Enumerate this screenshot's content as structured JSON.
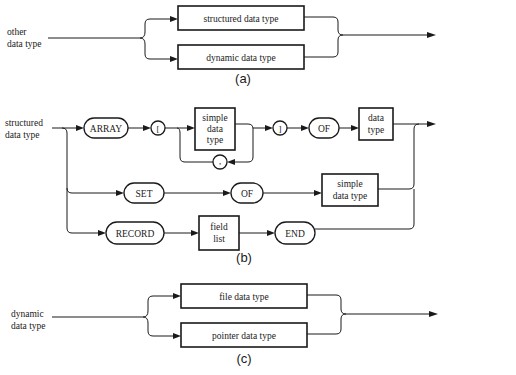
{
  "diagram_a": {
    "caption": "(a)",
    "input_label_line1": "other",
    "input_label_line2": "data type",
    "boxes": [
      "structured data type",
      "dynamic data type"
    ]
  },
  "diagram_b": {
    "caption": "(b)",
    "input_label_line1": "structured",
    "input_label_line2": "data type",
    "array_row": {
      "keyword": "ARRAY",
      "open_bracket": "[",
      "simple_type_lines": [
        "simple",
        "data",
        "type"
      ],
      "separator": ",",
      "close_bracket": "]",
      "of": "OF",
      "element_type_lines": [
        "data",
        "type"
      ]
    },
    "set_row": {
      "keyword": "SET",
      "of": "OF",
      "base_type_lines": [
        "simple",
        "data type"
      ]
    },
    "record_row": {
      "keyword": "RECORD",
      "field_list_lines": [
        "field",
        "list"
      ],
      "end": "END"
    }
  },
  "diagram_c": {
    "caption": "(c)",
    "input_label_line1": "dynamic",
    "input_label_line2": "data type",
    "boxes": [
      "file data type",
      "pointer data type"
    ]
  }
}
